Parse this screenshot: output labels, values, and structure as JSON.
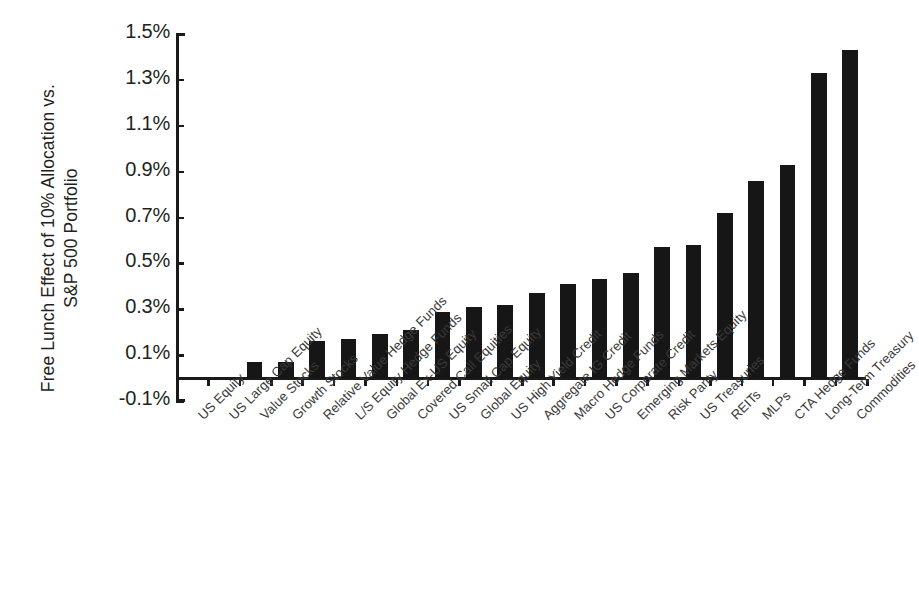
{
  "chart_data": {
    "type": "bar",
    "title": "",
    "subtitle": "",
    "xlabel": "",
    "ylabel": "Free Lunch Effect of 10% Allocation vs.\nS&P 500 Portfolio",
    "ylim": [
      -0.1,
      1.5
    ],
    "ytick_labels": [
      "1.5%",
      "1.3%",
      "1.1%",
      "0.9%",
      "0.7%",
      "0.5%",
      "0.3%",
      "0.1%",
      "-0.1%"
    ],
    "ytick_values": [
      1.5,
      1.3,
      1.1,
      0.9,
      0.7,
      0.5,
      0.3,
      0.1,
      -0.1
    ],
    "yunit": "%",
    "grid": false,
    "legend": false,
    "legend_position": "none",
    "bar_color": "#161616",
    "axis_color": "#1a1a1a",
    "background": "#ffffff",
    "categories": [
      "US Equity",
      "US Large Cap Equity",
      "Value Stocks",
      "Growth Stocks",
      "Relative Value Hedge Funds",
      "L/S Equity Hedge Funds",
      "Global Ex-US Equity",
      "Covered Call Equities",
      "US Small Cap Equity",
      "Global Equity",
      "US High Yield Credit",
      "Aggregate IG Credit",
      "Macro Hedge Funds",
      "US Corporate Credit",
      "Emerging Markets Equity",
      "Risk Parity",
      "US Treasuries",
      "REITs",
      "MLPs",
      "CTA Hedge Funds",
      "Long-Term Treasury",
      "Commodities"
    ],
    "values": [
      0.0,
      0.0,
      0.07,
      0.07,
      0.16,
      0.17,
      0.19,
      0.21,
      0.29,
      0.31,
      0.32,
      0.37,
      0.41,
      0.43,
      0.46,
      0.57,
      0.58,
      0.72,
      0.86,
      0.93,
      1.33,
      1.43
    ]
  }
}
